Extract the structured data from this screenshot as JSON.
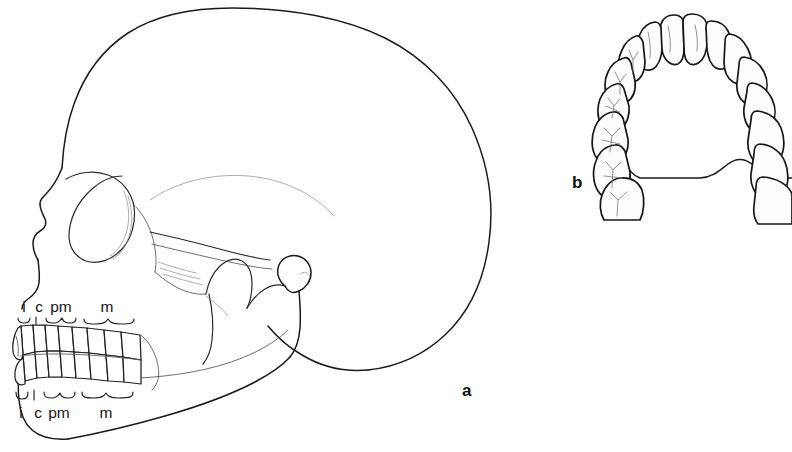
{
  "figure": {
    "background_color": "#ffffff",
    "line_color": "#1a1a1a",
    "width": 792,
    "height": 452,
    "panels": [
      {
        "id": "a",
        "label": "a",
        "label_x": 462,
        "label_y": 396,
        "description": "human skull lateral view with dentition"
      },
      {
        "id": "b",
        "label": "b",
        "label_x": 572,
        "label_y": 188,
        "description": "maxillary dental arch occlusal palatal view"
      }
    ]
  },
  "panel_a": {
    "label": "a",
    "upper_row": {
      "labels": [
        {
          "key": "incisor",
          "text": "i",
          "x": 24,
          "y": 312
        },
        {
          "key": "canine",
          "text": "c",
          "x": 39,
          "y": 312
        },
        {
          "key": "premolar",
          "text": "pm",
          "x": 57,
          "y": 312
        },
        {
          "key": "molar",
          "text": "m",
          "x": 102,
          "y": 312
        }
      ],
      "brackets": [
        {
          "key": "incisor-bracket",
          "x1": 20,
          "x2": 32,
          "y": 322,
          "dir": "down"
        },
        {
          "key": "canine-bracket",
          "x1": 34,
          "x2": 44,
          "y": 322,
          "dir": "down"
        },
        {
          "key": "premolar-bracket",
          "x1": 48,
          "x2": 80,
          "y": 322,
          "dir": "down"
        },
        {
          "key": "molar-bracket",
          "x1": 86,
          "x2": 142,
          "y": 322,
          "dir": "down"
        }
      ]
    },
    "lower_row": {
      "labels": [
        {
          "key": "incisor",
          "text": "i",
          "x": 21,
          "y": 414
        },
        {
          "key": "canine",
          "text": "c",
          "x": 36,
          "y": 414
        },
        {
          "key": "premolar",
          "text": "pm",
          "x": 54,
          "y": 414
        },
        {
          "key": "molar",
          "text": "m",
          "x": 101,
          "y": 414
        }
      ],
      "brackets": [
        {
          "key": "incisor-bracket",
          "x1": 17,
          "x2": 29,
          "y": 396,
          "dir": "up"
        },
        {
          "key": "canine-bracket",
          "x1": 32,
          "x2": 42,
          "y": 396,
          "dir": "up"
        },
        {
          "key": "premolar-bracket",
          "x1": 46,
          "x2": 78,
          "y": 396,
          "dir": "up"
        },
        {
          "key": "molar-bracket",
          "x1": 84,
          "x2": 140,
          "y": 396,
          "dir": "up"
        }
      ]
    },
    "tooth_classes": {
      "i": "incisor",
      "c": "canine",
      "pm": "premolar",
      "m": "molar"
    },
    "upper_teeth_count": 8,
    "lower_teeth_count": 8
  },
  "panel_b": {
    "label": "b",
    "arch_teeth_count": 16,
    "view": "occlusal"
  }
}
